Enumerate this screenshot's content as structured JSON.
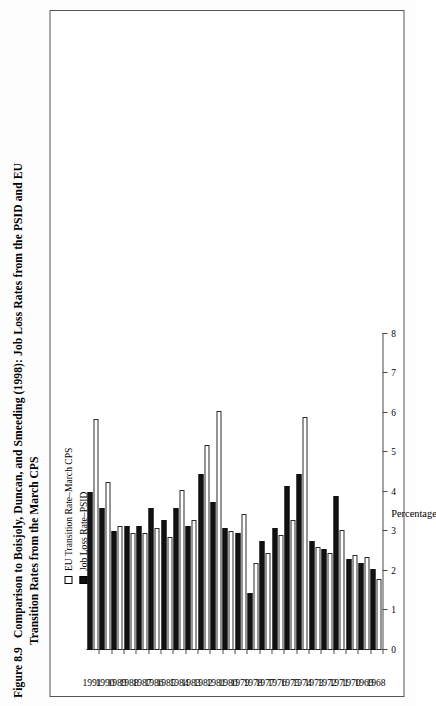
{
  "figure": {
    "number": "Figure 8.9",
    "caption_line1": "Comparison to Boisjoly, Duncan, and Smeeding (1998): Job Loss Rates from the PSID and EU",
    "caption_line2": "Transition Rates from the March CPS"
  },
  "legend": {
    "position": "top-left",
    "items": [
      {
        "label": "EU Transition Rate–March CPS",
        "swatch": "hollow",
        "color": "#ffffff"
      },
      {
        "label": "Job Loss Rate–PSID",
        "swatch": "filled",
        "color": "#111111"
      }
    ]
  },
  "axes": {
    "value_axis_title": "Percentage",
    "value_ticks": [
      "0",
      "1",
      "2",
      "3",
      "4",
      "5",
      "6",
      "7",
      "8"
    ],
    "value_min": 0,
    "value_max": 8,
    "category_axis_title": ""
  },
  "chart_data": {
    "type": "bar",
    "orientation": "horizontal",
    "title": "Comparison to Boisjoly, Duncan, and Smeeding (1998): Job Loss Rates from the PSID and EU Transition Rates from the March CPS",
    "xlabel": "Percentage",
    "ylabel": "",
    "xlim": [
      0,
      8
    ],
    "grid": false,
    "legend_position": "top-left",
    "categories": [
      "1968",
      "1969",
      "1970",
      "1971",
      "1972",
      "1973",
      "1974",
      "1975",
      "1976",
      "1977",
      "1978",
      "1979",
      "1980",
      "1981",
      "1982",
      "1983",
      "1984",
      "1985",
      "1986",
      "1987",
      "1988",
      "1989",
      "1990",
      "1991"
    ],
    "series": [
      {
        "name": "Job Loss Rate–PSID",
        "color": "#111111",
        "values": [
          2.05,
          2.2,
          2.3,
          3.9,
          2.55,
          2.75,
          4.45,
          4.15,
          3.1,
          2.75,
          1.45,
          2.95,
          3.1,
          3.75,
          4.45,
          3.15,
          3.6,
          3.3,
          3.6,
          3.15,
          3.15,
          3.0,
          3.6,
          4.0
        ]
      },
      {
        "name": "EU Transition Rate–March CPS",
        "color": "#ffffff",
        "values": [
          1.8,
          2.35,
          2.4,
          3.05,
          2.45,
          2.6,
          5.9,
          3.3,
          2.9,
          2.45,
          2.2,
          3.45,
          3.0,
          6.05,
          5.2,
          3.3,
          4.05,
          2.85,
          3.1,
          2.95,
          2.95,
          3.15,
          4.25,
          5.85
        ]
      }
    ]
  }
}
